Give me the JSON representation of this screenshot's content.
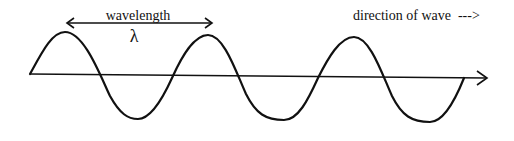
{
  "diagram": {
    "labels": {
      "wavelength": "wavelength",
      "lambda": "λ",
      "direction": "direction of wave  --->"
    },
    "colors": {
      "stroke": "#111111",
      "background": "#ffffff"
    },
    "wave": {
      "cycles": 3,
      "start": [
        30,
        74
      ],
      "peaks": [
        [
          65,
          32
        ],
        [
          208,
          35
        ],
        [
          354,
          37
        ]
      ],
      "troughs": [
        [
          138,
          119
        ],
        [
          284,
          120
        ],
        [
          430,
          122
        ]
      ],
      "end": [
        464,
        78
      ]
    },
    "axis": {
      "from": [
        30,
        74
      ],
      "to": [
        487,
        78
      ]
    },
    "wavelength_marker": {
      "from": [
        67,
        23
      ],
      "to": [
        212,
        23
      ]
    }
  }
}
